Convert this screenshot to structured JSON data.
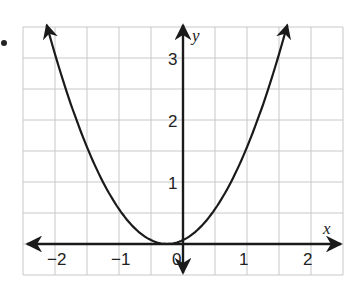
{
  "bullet": "•",
  "chart_data": {
    "type": "line",
    "title": "",
    "xlabel": "x",
    "ylabel": "y",
    "xlim": [
      -2.5,
      2.5
    ],
    "ylim": [
      -0.5,
      3.5
    ],
    "grid": true,
    "grid_step": 0.5,
    "x_ticks": [
      -2,
      -1,
      0,
      1,
      2
    ],
    "x_tick_labels": [
      "−2",
      "−1",
      "0",
      "1",
      "2"
    ],
    "y_ticks": [
      1,
      2,
      3
    ],
    "y_tick_labels": [
      "1",
      "2",
      "3"
    ],
    "series": [
      {
        "name": "parabola",
        "equation": "y = (x + 0.25)^2",
        "x": [
          -2.13,
          -2.0,
          -1.5,
          -1.0,
          -0.5,
          -0.25,
          0.0,
          0.5,
          1.0,
          1.5,
          1.63
        ],
        "y": [
          3.5,
          3.06,
          1.56,
          0.56,
          0.06,
          0.0,
          0.06,
          0.56,
          1.56,
          3.06,
          3.5
        ],
        "arrows_at_ends": true
      }
    ],
    "axes_arrows": true,
    "colors": {
      "grid": "#c8c8c8",
      "axis": "#1a1a1a",
      "curve": "#1a1a1a"
    }
  }
}
